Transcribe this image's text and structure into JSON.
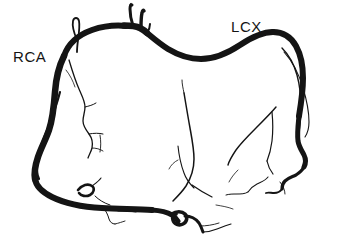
{
  "figure": {
    "type": "line-drawing",
    "background_color": "#ffffff",
    "stroke_color": "#141414",
    "width": 340,
    "height": 244,
    "labels": [
      {
        "id": "rca",
        "text": "RCA",
        "meaning": "right-coronary-artery",
        "x": 13,
        "y": 49,
        "font_size": 15,
        "color": "#141414"
      },
      {
        "id": "lcx",
        "text": "LCX",
        "meaning": "left-circumflex-artery",
        "x": 231,
        "y": 19,
        "font_size": 15,
        "color": "#141414"
      }
    ],
    "vessels": [
      {
        "name": "rca-main-trunk",
        "label": "RCA",
        "weight": "thick",
        "description": "Thick vessel ascending at left, arcing over the top-left, descending down the left margin and sweeping across the bottom."
      },
      {
        "name": "lcx-main-trunk",
        "label": "LCX",
        "weight": "thick",
        "description": "Thick vessel arcing over the top-right from the apex bifurcation and descending the right margin."
      },
      {
        "name": "apex-branch-superior-a",
        "weight": "thin",
        "description": "Short upward stub at top-center bifurcation."
      },
      {
        "name": "apex-branch-superior-b",
        "weight": "thin",
        "description": "Second short upward stub at top-center bifurcation."
      },
      {
        "name": "rca-hairpin-loop",
        "weight": "thin",
        "description": "Hairpin loop branch near top-left shoulder of RCA."
      },
      {
        "name": "acute-marginal-branch",
        "weight": "thin",
        "description": "Thin branch descending in the left-central field from the RCA."
      },
      {
        "name": "posterior-descending-branch",
        "weight": "thin",
        "description": "Thin central branch descending toward the bottom crossing point."
      },
      {
        "name": "obtuse-marginal-branch",
        "weight": "thin",
        "description": "Thin branch on the right-central field paralleling the LCX."
      },
      {
        "name": "distal-lcx-terminal-branches",
        "weight": "thin",
        "description": "Fine notched terminal twigs at the lower-right."
      },
      {
        "name": "inferior-crossing-loop",
        "weight": "thick",
        "description": "Small loop where vessels cross at the bottom-center."
      },
      {
        "name": "inferior-left-loop",
        "weight": "thin",
        "description": "Small loop branch on the lower-left of the bottom sweep."
      }
    ]
  }
}
